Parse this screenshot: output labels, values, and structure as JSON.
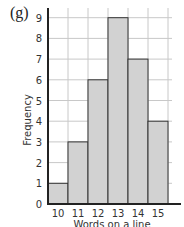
{
  "figure_label": "(g)",
  "chart_data": {
    "type": "bar",
    "subtype": "histogram",
    "title": "",
    "panel_label": "(g)",
    "xlabel": "Words on a line",
    "ylabel": "Frequency",
    "categories": [
      "10",
      "11",
      "12",
      "13",
      "14",
      "15"
    ],
    "values": [
      1,
      3,
      6,
      9,
      7,
      4
    ],
    "ylim": [
      0,
      9
    ],
    "yticks": [
      0,
      1,
      2,
      3,
      4,
      5,
      6,
      7,
      8,
      9
    ],
    "grid": true,
    "legend": null,
    "bar_color": "#d2d2d2"
  },
  "colors": {
    "bar_fill": "#d2d2d2",
    "bar_edge": "#333333",
    "grid": "#c8c8c8",
    "axis": "#222222"
  }
}
